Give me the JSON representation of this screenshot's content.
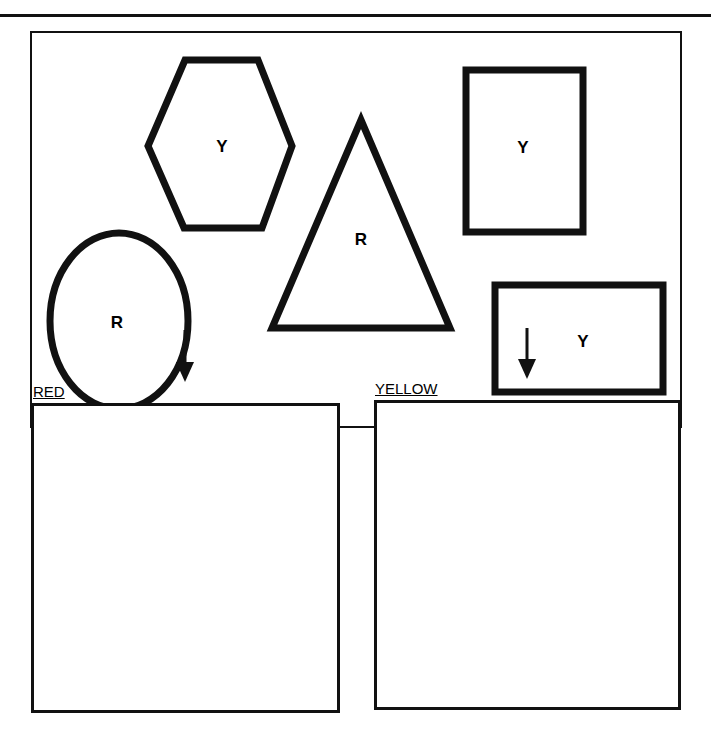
{
  "worksheet": {
    "source_panel": {
      "shapes": [
        {
          "type": "hexagon",
          "letter": "Y"
        },
        {
          "type": "triangle",
          "letter": "R"
        },
        {
          "type": "square",
          "letter": "Y"
        },
        {
          "type": "circle",
          "letter": "R"
        },
        {
          "type": "rectangle",
          "letter": "Y"
        }
      ]
    },
    "bins": [
      {
        "label": "RED"
      },
      {
        "label": "YELLOW"
      }
    ]
  }
}
